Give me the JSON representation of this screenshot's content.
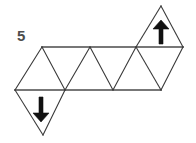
{
  "figure": {
    "label": "5",
    "label_position": {
      "x": 17,
      "y": 41
    },
    "ink_color": "#3a3a3a",
    "arrow_color": "#111111",
    "label_color": "#4d4d4d",
    "background_color": "#ffffff",
    "geometry": {
      "top_row_y": 47,
      "bottom_row_y": 90,
      "top_vertices_x": [
        42,
        90,
        136,
        183
      ],
      "bottom_vertices_x": [
        15,
        65,
        113,
        161
      ],
      "down_triangle_apex": {
        "x": 43,
        "y": 135
      },
      "up_triangle_apex": {
        "x": 161,
        "y": 6
      }
    },
    "edges": [
      {
        "name": "top-horizontal-line",
        "x1": 42,
        "y1": 47,
        "x2": 183,
        "y2": 47
      },
      {
        "name": "bottom-horizontal-line",
        "x1": 15,
        "y1": 90,
        "x2": 161,
        "y2": 90
      },
      {
        "name": "diagonal-1",
        "x1": 15,
        "y1": 90,
        "x2": 42,
        "y2": 47
      },
      {
        "name": "diagonal-2",
        "x1": 42,
        "y1": 47,
        "x2": 65,
        "y2": 90
      },
      {
        "name": "diagonal-3",
        "x1": 65,
        "y1": 90,
        "x2": 90,
        "y2": 47
      },
      {
        "name": "diagonal-4",
        "x1": 90,
        "y1": 47,
        "x2": 113,
        "y2": 90
      },
      {
        "name": "diagonal-5",
        "x1": 113,
        "y1": 90,
        "x2": 136,
        "y2": 47
      },
      {
        "name": "diagonal-6",
        "x1": 136,
        "y1": 47,
        "x2": 161,
        "y2": 90
      },
      {
        "name": "diagonal-7",
        "x1": 161,
        "y1": 90,
        "x2": 183,
        "y2": 47
      },
      {
        "name": "down-flap-left-edge",
        "x1": 15,
        "y1": 90,
        "x2": 43,
        "y2": 135
      },
      {
        "name": "down-flap-right-edge",
        "x1": 43,
        "y1": 135,
        "x2": 65,
        "y2": 90
      },
      {
        "name": "up-flap-left-edge",
        "x1": 136,
        "y1": 47,
        "x2": 161,
        "y2": 6
      },
      {
        "name": "up-flap-right-edge",
        "x1": 161,
        "y1": 6,
        "x2": 183,
        "y2": 47
      }
    ],
    "arrows": [
      {
        "name": "down-arrow",
        "direction": "down",
        "cx": 41,
        "shaft_top_y": 97,
        "shaft_bottom_y": 113,
        "tip_y": 122,
        "shaft_width": 4,
        "head_half_width": 8
      },
      {
        "name": "up-arrow",
        "direction": "up",
        "cx": 161,
        "shaft_bottom_y": 44,
        "shaft_top_y": 29,
        "tip_y": 20,
        "shaft_width": 4,
        "head_half_width": 8
      }
    ]
  }
}
